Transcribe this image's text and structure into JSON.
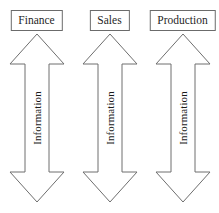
{
  "diagram": {
    "type": "information-flow-diagram",
    "background_color": "#ffffff",
    "line_color": "#6e6e6e",
    "text_color": "#1f1f1f",
    "columns": [
      {
        "department": "Finance",
        "arrow": {
          "direction": "double-vertical",
          "label": "Information"
        }
      },
      {
        "department": "Sales",
        "arrow": {
          "direction": "double-vertical",
          "label": "Information"
        }
      },
      {
        "department": "Production",
        "arrow": {
          "direction": "double-vertical",
          "label": "Information"
        }
      }
    ]
  }
}
